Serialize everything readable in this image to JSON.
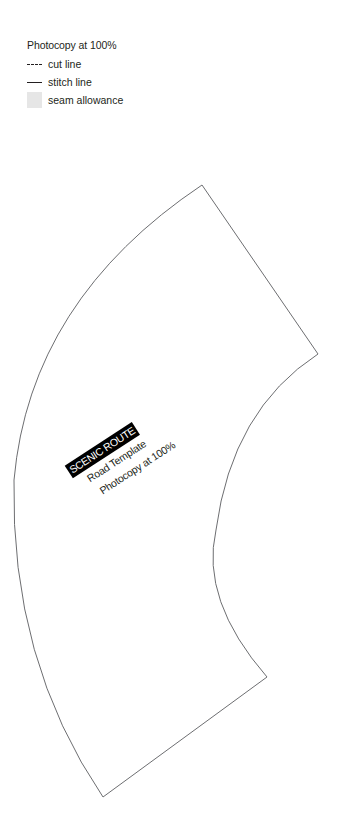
{
  "legend": {
    "title": "Photocopy at 100%",
    "items": [
      {
        "symbol": "dashed-line",
        "label": "cut line"
      },
      {
        "symbol": "solid-line",
        "label": "stitch line"
      },
      {
        "symbol": "gray-fill",
        "label": "seam allowance",
        "color": "#e6e6e6"
      }
    ]
  },
  "template": {
    "name": "SCENIC ROUTE",
    "subtitle": "Road Template",
    "instruction": "Photocopy at 100%",
    "outline_color": "#6d6e71"
  }
}
